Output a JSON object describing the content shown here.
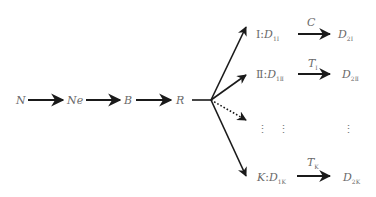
{
  "chain": {
    "nodes": [
      "N",
      "Ne",
      "B",
      "R"
    ]
  },
  "branches": [
    {
      "roman": "Ⅰ",
      "sep": ":",
      "src": "D",
      "src_sub": "1Ⅰ",
      "edge": "C",
      "edge_sub": "",
      "dst": "D",
      "dst_sub": "2Ⅰ"
    },
    {
      "roman": "Ⅱ",
      "sep": ":",
      "src": "D",
      "src_sub": "1Ⅱ",
      "edge": "T",
      "edge_sub": "Ⅰ",
      "dst": "D",
      "dst_sub": "2Ⅱ"
    },
    {
      "roman": "K",
      "sep": ":",
      "src": "D",
      "src_sub": "1K",
      "edge": "T",
      "edge_sub": "K",
      "dst": "D",
      "dst_sub": "2K"
    }
  ],
  "ellipsis": {
    "col1": "⋮",
    "col2": "⋮",
    "col3": "⋮"
  },
  "colors": {
    "stroke": "#1a1a1a",
    "text": "#6a6a6a"
  }
}
